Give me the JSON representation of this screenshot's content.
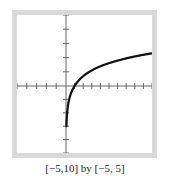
{
  "chart_data": {
    "type": "line",
    "function": "y = ln(x)",
    "title": "",
    "xlabel": "",
    "ylabel": "",
    "xlim": [
      -5,
      10
    ],
    "ylim": [
      -5,
      5
    ],
    "xtick_step": 1,
    "ytick_step": 1,
    "grid": false,
    "legend": null,
    "caption": "[−5,10] by [−5, 5]",
    "series": [
      {
        "name": "curve",
        "color": "#111111",
        "x": [
          0.05,
          0.1,
          0.2,
          0.3,
          0.5,
          0.75,
          1,
          1.5,
          2,
          3,
          4,
          5,
          6,
          7,
          8,
          9,
          10
        ],
        "y": [
          -3.0,
          -2.3,
          -1.61,
          -1.2,
          -0.69,
          -0.29,
          0,
          0.41,
          0.69,
          1.1,
          1.39,
          1.61,
          1.79,
          1.95,
          2.08,
          2.2,
          2.3
        ]
      }
    ]
  },
  "caption": "[−5,10] by [−5, 5]",
  "colors": {
    "frame": "#d9d9d9",
    "axis": "#666666",
    "curve": "#111111"
  }
}
